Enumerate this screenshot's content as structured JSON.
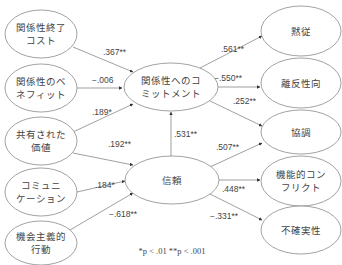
{
  "diagram": {
    "nodes": [
      {
        "id": "termination_cost",
        "lines": [
          "関係性終了",
          "コスト"
        ]
      },
      {
        "id": "relationship_benefit",
        "lines": [
          "関係性のベ",
          "ネフィット"
        ]
      },
      {
        "id": "shared_values",
        "lines": [
          "共有された",
          "価値"
        ]
      },
      {
        "id": "communication",
        "lines": [
          "コミュニ",
          "ケーション"
        ]
      },
      {
        "id": "opportunistic_behavior",
        "lines": [
          "機会主義的",
          "行動"
        ]
      },
      {
        "id": "commitment",
        "lines": [
          "関係性へのコ",
          "ミットメント"
        ]
      },
      {
        "id": "trust",
        "lines": [
          "信頼"
        ]
      },
      {
        "id": "acquiescence",
        "lines": [
          "黙従"
        ]
      },
      {
        "id": "propensity_to_leave",
        "lines": [
          "離反性向"
        ]
      },
      {
        "id": "cooperation",
        "lines": [
          "協調"
        ]
      },
      {
        "id": "functional_conflict",
        "lines": [
          "機能的コン",
          "フリクト"
        ]
      },
      {
        "id": "uncertainty",
        "lines": [
          "不確実性"
        ]
      }
    ],
    "edges": [
      {
        "from": "termination_cost",
        "to": "commitment",
        "label": ".367**"
      },
      {
        "from": "relationship_benefit",
        "to": "commitment",
        "label": "−.006"
      },
      {
        "from": "shared_values",
        "to": "commitment",
        "label": ".189*"
      },
      {
        "from": "shared_values",
        "to": "trust",
        "label": ".192**"
      },
      {
        "from": "communication",
        "to": "trust",
        "label": ".184*"
      },
      {
        "from": "opportunistic_behavior",
        "to": "trust",
        "label": "−.618**"
      },
      {
        "from": "trust",
        "to": "commitment",
        "label": ".531**"
      },
      {
        "from": "commitment",
        "to": "acquiescence",
        "label": ".561**"
      },
      {
        "from": "commitment",
        "to": "propensity_to_leave",
        "label": "−.550**"
      },
      {
        "from": "commitment",
        "to": "cooperation",
        "label": ".252**"
      },
      {
        "from": "trust",
        "to": "cooperation",
        "label": ".507**"
      },
      {
        "from": "trust",
        "to": "functional_conflict",
        "label": ".448**"
      },
      {
        "from": "trust",
        "to": "uncertainty",
        "label": "−.331**"
      }
    ],
    "note": "*p < .01   **p < .001"
  }
}
